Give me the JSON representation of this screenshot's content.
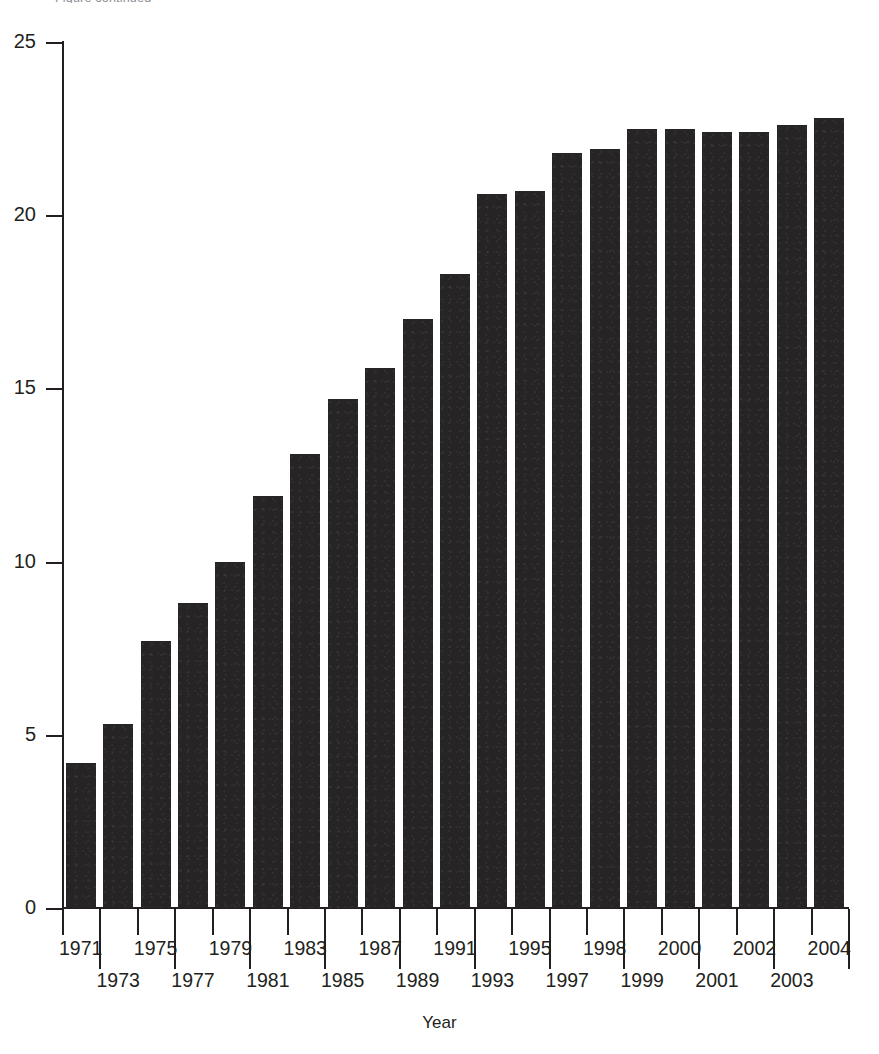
{
  "top_caption": "Figure continued",
  "axes": {
    "x_title": "Year",
    "y_title": "",
    "y_ticks": [
      "0",
      "5",
      "10",
      "15",
      "20",
      "25"
    ]
  },
  "chart_data": {
    "type": "bar",
    "title": "",
    "subtitle": "",
    "xlabel": "Year",
    "ylabel": "",
    "ylim": [
      0,
      25
    ],
    "xlim_categories": 20,
    "grid": false,
    "legend": null,
    "bar_color": "#262425",
    "axis_color": "#231f20",
    "categories": [
      "1971",
      "1973",
      "1975",
      "1977",
      "1979",
      "1981",
      "1983",
      "1985",
      "1987",
      "1989",
      "1991",
      "1993",
      "1995",
      "1997",
      "1998",
      "1999",
      "2000",
      "2001",
      "2002",
      "2003",
      "2004"
    ],
    "tick_labels_row_top": [
      "1971",
      "1975",
      "1979",
      "1983",
      "1987",
      "1991",
      "1995",
      "1998",
      "2000",
      "2002",
      "2004"
    ],
    "tick_labels_row_bottom": [
      "1973",
      "1977",
      "1981",
      "1985",
      "1989",
      "1993",
      "1997",
      "1999",
      "2001",
      "2003"
    ],
    "values": [
      4.2,
      5.3,
      7.7,
      8.8,
      10.0,
      11.9,
      13.1,
      14.7,
      15.6,
      17.0,
      18.3,
      20.6,
      20.7,
      21.8,
      21.9,
      22.5,
      22.5,
      22.4,
      22.4,
      22.6,
      22.8
    ],
    "series": [
      {
        "name": "value",
        "values": [
          4.2,
          5.3,
          7.7,
          8.8,
          10.0,
          11.9,
          13.1,
          14.7,
          15.6,
          17.0,
          18.3,
          20.6,
          20.7,
          21.8,
          21.9,
          22.5,
          22.5,
          22.4,
          22.4,
          22.6,
          22.8
        ]
      }
    ]
  }
}
